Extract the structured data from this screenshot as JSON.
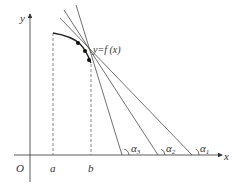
{
  "diagram": {
    "axes": {
      "x_label": "x",
      "y_label": "y",
      "origin_label": "O"
    },
    "tick_labels": {
      "a": "a",
      "b": "b"
    },
    "curve_label": "y=f (x)",
    "angle_labels": [
      {
        "symbol": "α",
        "subscript": "3"
      },
      {
        "symbol": "α",
        "subscript": "2"
      },
      {
        "symbol": "α",
        "subscript": "1"
      }
    ],
    "colors": {
      "line": "#333333",
      "dashed": "#555555",
      "background": "#ffffff"
    }
  }
}
